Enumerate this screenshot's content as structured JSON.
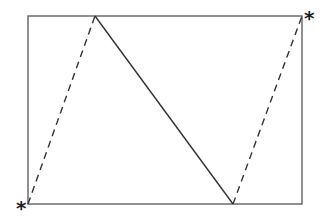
{
  "diagram": {
    "rectangle": {
      "x1": 28,
      "y1": 16,
      "x2": 302,
      "y2": 204,
      "stroke": "#555555"
    },
    "solid_line": {
      "from": [
        95,
        16
      ],
      "to": [
        233,
        204
      ],
      "stroke": "#333333"
    },
    "dashed_lines": [
      {
        "from": [
          28,
          204
        ],
        "to": [
          95,
          16
        ]
      },
      {
        "from": [
          233,
          204
        ],
        "to": [
          302,
          16
        ]
      }
    ],
    "markers": [
      {
        "label": "*",
        "position": "bottom-left"
      },
      {
        "label": "*",
        "position": "top-right"
      }
    ]
  }
}
